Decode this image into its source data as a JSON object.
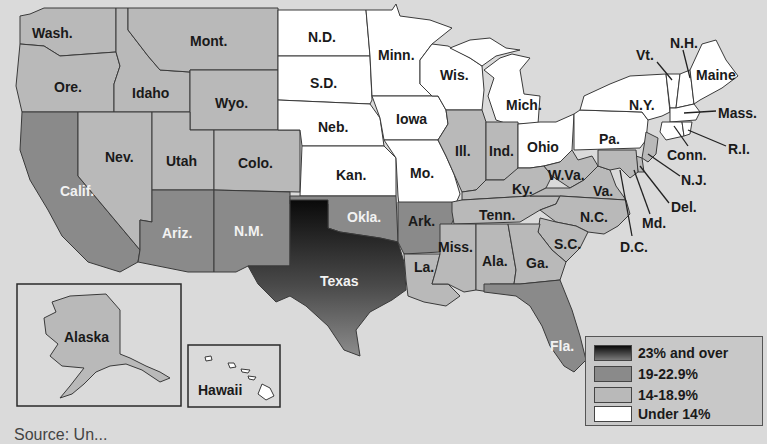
{
  "map": {
    "title": "",
    "colors": {
      "background": "#dadada",
      "tier_23_plus_top": "#0a0a0a",
      "tier_23_plus_bottom": "#8c8c8c",
      "tier_19_22_9": "#8a8a8a",
      "tier_14_18_9": "#b9b9b9",
      "tier_under_14": "#ffffff"
    },
    "legend": {
      "items": [
        {
          "label": "23% and over",
          "tier": "23+"
        },
        {
          "label": "19-22.9%",
          "tier": "19-22.9"
        },
        {
          "label": "14-18.9%",
          "tier": "14-18.9"
        },
        {
          "label": "Under 14%",
          "tier": "<14"
        }
      ]
    },
    "states": {
      "wash": {
        "label": "Wash.",
        "tier": "14-18.9"
      },
      "ore": {
        "label": "Ore.",
        "tier": "14-18.9"
      },
      "calif": {
        "label": "Calif.",
        "tier": "19-22.9"
      },
      "idaho": {
        "label": "Idaho",
        "tier": "14-18.9"
      },
      "nev": {
        "label": "Nev.",
        "tier": "14-18.9"
      },
      "mont": {
        "label": "Mont.",
        "tier": "14-18.9"
      },
      "wyo": {
        "label": "Wyo.",
        "tier": "14-18.9"
      },
      "utah": {
        "label": "Utah",
        "tier": "14-18.9"
      },
      "colo": {
        "label": "Colo.",
        "tier": "14-18.9"
      },
      "ariz": {
        "label": "Ariz.",
        "tier": "19-22.9"
      },
      "nm": {
        "label": "N.M.",
        "tier": "19-22.9"
      },
      "nd": {
        "label": "N.D.",
        "tier": "<14"
      },
      "sd": {
        "label": "S.D.",
        "tier": "<14"
      },
      "neb": {
        "label": "Neb.",
        "tier": "<14"
      },
      "kan": {
        "label": "Kan.",
        "tier": "<14"
      },
      "okla": {
        "label": "Okla.",
        "tier": "19-22.9"
      },
      "texas": {
        "label": "Texas",
        "tier": "23+"
      },
      "minn": {
        "label": "Minn.",
        "tier": "<14"
      },
      "iowa": {
        "label": "Iowa",
        "tier": "<14"
      },
      "mo": {
        "label": "Mo.",
        "tier": "<14"
      },
      "ark": {
        "label": "Ark.",
        "tier": "19-22.9"
      },
      "la": {
        "label": "La.",
        "tier": "14-18.9"
      },
      "wis": {
        "label": "Wis.",
        "tier": "<14"
      },
      "ill": {
        "label": "Ill.",
        "tier": "14-18.9"
      },
      "mich": {
        "label": "Mich.",
        "tier": "<14"
      },
      "ind": {
        "label": "Ind.",
        "tier": "14-18.9"
      },
      "ohio": {
        "label": "Ohio",
        "tier": "<14"
      },
      "ky": {
        "label": "Ky.",
        "tier": "14-18.9"
      },
      "tenn": {
        "label": "Tenn.",
        "tier": "14-18.9"
      },
      "miss": {
        "label": "Miss.",
        "tier": "14-18.9"
      },
      "ala": {
        "label": "Ala.",
        "tier": "14-18.9"
      },
      "ga": {
        "label": "Ga.",
        "tier": "14-18.9"
      },
      "fla": {
        "label": "Fla.",
        "tier": "19-22.9"
      },
      "sc": {
        "label": "S.C.",
        "tier": "14-18.9"
      },
      "nc": {
        "label": "N.C.",
        "tier": "14-18.9"
      },
      "va": {
        "label": "Va.",
        "tier": "14-18.9"
      },
      "wva": {
        "label": "W.Va.",
        "tier": "14-18.9"
      },
      "pa": {
        "label": "Pa.",
        "tier": "<14"
      },
      "ny": {
        "label": "N.Y.",
        "tier": "<14"
      },
      "vt": {
        "label": "Vt.",
        "tier": "<14"
      },
      "nh": {
        "label": "N.H.",
        "tier": "<14"
      },
      "maine": {
        "label": "Maine",
        "tier": "<14"
      },
      "mass": {
        "label": "Mass.",
        "tier": "<14"
      },
      "ri": {
        "label": "R.I.",
        "tier": "<14"
      },
      "conn": {
        "label": "Conn.",
        "tier": "<14"
      },
      "nj": {
        "label": "N.J.",
        "tier": "14-18.9"
      },
      "del": {
        "label": "Del.",
        "tier": "14-18.9"
      },
      "md": {
        "label": "Md.",
        "tier": "14-18.9"
      },
      "dc": {
        "label": "D.C.",
        "tier": "14-18.9"
      },
      "alaska": {
        "label": "Alaska",
        "tier": "14-18.9"
      },
      "hawaii": {
        "label": "Hawaii",
        "tier": "<14"
      }
    },
    "source_text": "Source: Un..."
  }
}
